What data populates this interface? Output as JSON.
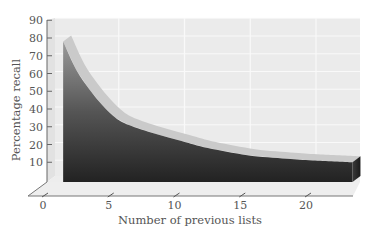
{
  "chart_data": {
    "type": "area",
    "title": "",
    "xlabel": "Number of previous lists",
    "ylabel": "Percentage recall",
    "x_ticks": [
      0,
      5,
      10,
      15,
      20
    ],
    "y_ticks": [
      10,
      20,
      30,
      40,
      50,
      60,
      70,
      80,
      90
    ],
    "xlim": [
      0,
      23
    ],
    "ylim": [
      0,
      90
    ],
    "grid": true,
    "style": "3D shaded area with gradient fill",
    "series": [
      {
        "name": "Recall",
        "x": [
          1,
          2,
          3,
          4,
          5,
          6,
          8,
          10,
          12,
          15,
          18,
          20,
          23
        ],
        "values": [
          78,
          62,
          51,
          42,
          35,
          31,
          26,
          22,
          18,
          14,
          12,
          11,
          10
        ]
      }
    ],
    "colors": {
      "panel": "#ebebeb",
      "grid": "#f8f8f8",
      "area_top": "#8a8a8a",
      "area_bottom": "#262626",
      "highlight": "#c9c9c9",
      "axis": "#666666"
    }
  },
  "axes": {
    "x_title": "Number of previous lists",
    "y_title": "Percentage recall",
    "x_tick_labels": [
      "0",
      "5",
      "10",
      "15",
      "20"
    ],
    "y_tick_labels": [
      "90",
      "80",
      "70",
      "60",
      "50",
      "40",
      "30",
      "20",
      "10"
    ]
  }
}
